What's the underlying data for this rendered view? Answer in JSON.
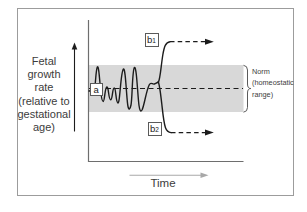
{
  "figure": {
    "y_axis": {
      "lines": [
        "Fetal",
        "growth",
        "rate",
        "(relative to",
        "gestational",
        "age)"
      ]
    },
    "x_axis": {
      "label": "Time"
    },
    "nodes": {
      "a": {
        "label": "a"
      },
      "b1": {
        "base": "b",
        "sub": "1"
      },
      "b2": {
        "base": "b",
        "sub": "2"
      }
    },
    "annotation": {
      "lines": [
        "Norm",
        "(homeostatic",
        "range)"
      ]
    },
    "colors": {
      "band": "#d8d8d8",
      "curve": "#1c1c1c",
      "axis": "#6e6e6e",
      "frame": "#9c9c9c",
      "muted_arrow": "#a8a8a8",
      "text": "#3c3c3c",
      "box_border": "#5a5a5a"
    }
  }
}
